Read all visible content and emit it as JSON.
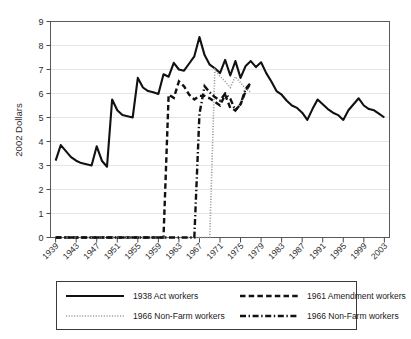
{
  "chart_data": {
    "type": "line",
    "title": "",
    "xlabel": "",
    "ylabel": "2002 Dollars",
    "xlim": [
      1938,
      2004
    ],
    "ylim": [
      0,
      9
    ],
    "grid": true,
    "legend_position": "below",
    "xticks": [
      "1939",
      "1943",
      "1947",
      "1951",
      "1955",
      "1959",
      "1963",
      "1967",
      "1971",
      "1975",
      "1979",
      "1983",
      "1987",
      "1991",
      "1995",
      "1999",
      "2003"
    ],
    "yticks": [
      "0",
      "1",
      "2",
      "3",
      "4",
      "5",
      "6",
      "7",
      "8",
      "9"
    ],
    "x": [
      1939,
      1940,
      1941,
      1942,
      1943,
      1944,
      1945,
      1946,
      1947,
      1948,
      1949,
      1950,
      1951,
      1952,
      1953,
      1954,
      1955,
      1956,
      1957,
      1958,
      1959,
      1960,
      1961,
      1962,
      1963,
      1964,
      1965,
      1966,
      1967,
      1968,
      1969,
      1970,
      1971,
      1972,
      1973,
      1974,
      1975,
      1976,
      1977,
      1978,
      1979,
      1980,
      1981,
      1982,
      1983,
      1984,
      1985,
      1986,
      1987,
      1988,
      1989,
      1990,
      1991,
      1992,
      1993,
      1994,
      1995,
      1996,
      1997,
      1998,
      1999,
      2000,
      2001,
      2002,
      2003
    ],
    "series": [
      {
        "name": "1938 Act workers",
        "style": "solid",
        "color": "#111111",
        "values": [
          3.2,
          3.85,
          3.6,
          3.35,
          3.2,
          3.1,
          3.05,
          3.0,
          3.8,
          3.2,
          2.95,
          5.75,
          5.3,
          5.1,
          5.05,
          5.0,
          6.65,
          6.25,
          6.1,
          6.05,
          5.98,
          6.8,
          6.7,
          7.28,
          7.0,
          6.95,
          7.25,
          7.55,
          8.35,
          7.6,
          7.2,
          7.05,
          6.85,
          7.4,
          6.75,
          7.35,
          6.65,
          7.15,
          7.35,
          7.1,
          7.3,
          6.85,
          6.5,
          6.1,
          5.95,
          5.7,
          5.5,
          5.4,
          5.2,
          4.9,
          5.35,
          5.75,
          5.55,
          5.35,
          5.2,
          5.1,
          4.9,
          5.3,
          5.55,
          5.8,
          5.5,
          5.35,
          5.3,
          5.15,
          5.0
        ]
      },
      {
        "name": "1961 Amendment workers",
        "style": "dashed",
        "color": "#111111",
        "values": [
          0,
          0,
          0,
          0,
          0,
          0,
          0,
          0,
          0,
          0,
          0,
          0,
          0,
          0,
          0,
          0,
          0,
          0,
          0,
          0,
          0,
          0,
          5.95,
          5.82,
          6.5,
          6.3,
          5.95,
          5.75,
          5.9,
          5.9,
          5.8,
          5.65,
          5.5,
          5.95,
          5.4,
          5.3,
          5.55,
          6.1,
          6.45,
          null,
          null,
          null,
          null,
          null,
          null,
          null,
          null,
          null,
          null,
          null,
          null,
          null,
          null,
          null,
          null,
          null,
          null,
          null,
          null,
          null,
          null,
          null,
          null,
          null,
          null
        ]
      },
      {
        "name": "1966 Non-Farm workers",
        "style": "dotted",
        "color": "#9a9a9a",
        "values": [
          0,
          0,
          0,
          0,
          0,
          0,
          0,
          0,
          0,
          0,
          0,
          0,
          0,
          0,
          0,
          0,
          0,
          0,
          0,
          0,
          0,
          0,
          0,
          0,
          0,
          0,
          0,
          0,
          0,
          0,
          0,
          7.0,
          6.72,
          6.5,
          6.25,
          6.7,
          6.45,
          6.2,
          6.05,
          null,
          null,
          null,
          null,
          null,
          null,
          null,
          null,
          null,
          null,
          null,
          null,
          null,
          null,
          null,
          null,
          null,
          null,
          null,
          null,
          null,
          null,
          null,
          null,
          null,
          null
        ]
      },
      {
        "name": "1966 Non-Farm workers",
        "style": "dashdot",
        "color": "#111111",
        "values": [
          0,
          0,
          0,
          0,
          0,
          0,
          0,
          0,
          0,
          0,
          0,
          0,
          0,
          0,
          0,
          0,
          0,
          0,
          0,
          0,
          0,
          0,
          0,
          0,
          0,
          0,
          0,
          0,
          5.15,
          6.3,
          6.05,
          5.85,
          5.7,
          6.0,
          5.78,
          5.3,
          5.55,
          6.2,
          6.45,
          null,
          null,
          null,
          null,
          null,
          null,
          null,
          null,
          null,
          null,
          null,
          null,
          null,
          null,
          null,
          null,
          null,
          null,
          null,
          null,
          null,
          null,
          null,
          null,
          null,
          null
        ]
      }
    ]
  },
  "legend": {
    "entries": [
      {
        "label": "1938 Act workers",
        "style": "solid"
      },
      {
        "label": "1961 Amendment workers",
        "style": "dashed"
      },
      {
        "label": "1966 Non-Farm workers",
        "style": "dotted"
      },
      {
        "label": "1966 Non-Farm workers",
        "style": "dashdot"
      }
    ]
  }
}
